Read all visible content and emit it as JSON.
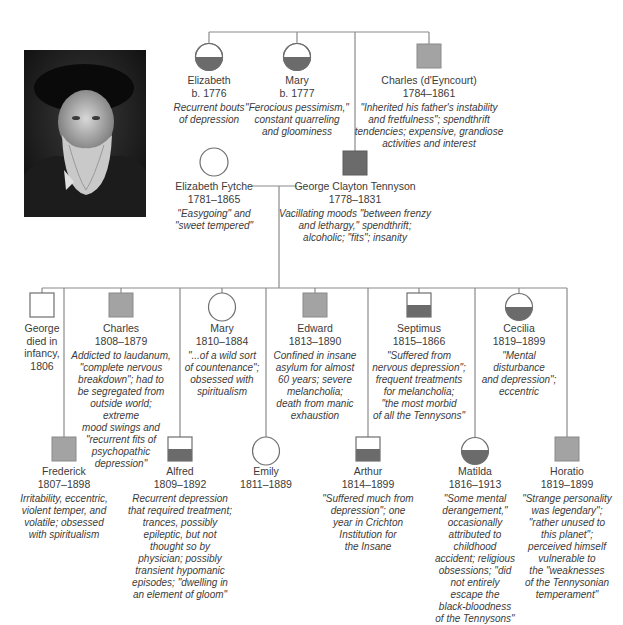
{
  "colors": {
    "line": "#8a8a8a",
    "affected_dark": "#6b6b6b",
    "affected_light": "#a3a3a3",
    "outline": "#6e6e6e"
  },
  "portrait": {
    "alt": "Portrait photograph of Alfred, Lord Tennyson"
  },
  "generation1": [
    {
      "id": "elizabeth-1776",
      "name": "Elizabeth",
      "dates": "b. 1776",
      "sex": "female",
      "fill": "half-dark",
      "desc": "Recurrent bouts\nof depression"
    },
    {
      "id": "mary-1777",
      "name": "Mary",
      "dates": "b. 1777",
      "sex": "female",
      "fill": "half-dark",
      "desc": "\"Ferocious pessimism,\"\nconstant quarreling\nand gloominess"
    },
    {
      "id": "charles-deyncourt",
      "name": "Charles (d'Eyncourt)",
      "dates": "1784–1861",
      "sex": "male",
      "fill": "light",
      "desc": "\"Inherited his father's instability\nand fretfulness\"; spendthrift\ntendencies; expensive, grandiose\nactivities and interest"
    }
  ],
  "generation2": [
    {
      "id": "elizabeth-fytche",
      "name": "Elizabeth Fytche",
      "dates": "1781–1865",
      "sex": "female",
      "fill": "none",
      "desc": "\"Easygoing\" and\n\"sweet tempered\""
    },
    {
      "id": "george-clayton-tennyson",
      "name": "George Clayton Tennyson",
      "dates": "1778–1831",
      "sex": "male",
      "fill": "dark",
      "desc": "Vacillating moods \"between frenzy\nand lethargy,\" spendthrift;\nalcoholic; \"fits\"; insanity"
    }
  ],
  "children_upper": [
    {
      "id": "george-1806",
      "name": "George\ndied in\ninfancy,\n1806",
      "dates": "",
      "sex": "male",
      "fill": "none",
      "desc": ""
    },
    {
      "id": "charles-1808",
      "name": "Charles",
      "dates": "1808–1879",
      "sex": "male",
      "fill": "light",
      "desc": "Addicted to laudanum,\n\"complete nervous\nbreakdown\"; had to\nbe segregated from\noutside world; extreme\nmood swings and\n\"recurrent fits of\npsychopathic\ndepression\""
    },
    {
      "id": "mary-1810",
      "name": "Mary",
      "dates": "1810–1884",
      "sex": "female",
      "fill": "none",
      "desc": "\"...of a wild sort\nof countenance\";\nobsessed with\nspiritualism"
    },
    {
      "id": "edward-1813",
      "name": "Edward",
      "dates": "1813–1890",
      "sex": "male",
      "fill": "light",
      "desc": "Confined in insane\nasylum for almost\n60 years; severe\nmelancholia;\ndeath from manic\nexhaustion"
    },
    {
      "id": "septimus-1815",
      "name": "Septimus",
      "dates": "1815–1866",
      "sex": "male",
      "fill": "half-dark",
      "desc": "\"Suffered from\nnervous depression\";\nfrequent treatments\nfor melancholia;\n\"the most morbid\nof all the Tennysons\""
    },
    {
      "id": "cecilia-1819",
      "name": "Cecilia",
      "dates": "1819–1899",
      "sex": "female",
      "fill": "half-dark",
      "desc": "\"Mental\ndisturbance\nand depression\";\neccentric"
    }
  ],
  "children_lower": [
    {
      "id": "frederick-1807",
      "name": "Frederick",
      "dates": "1807–1898",
      "sex": "male",
      "fill": "light",
      "desc": "Irritability, eccentric,\nviolent temper, and\nvolatile; obsessed\nwith spiritualism"
    },
    {
      "id": "alfred-1809",
      "name": "Alfred",
      "dates": "1809–1892",
      "sex": "male",
      "fill": "half-dark",
      "desc": "Recurrent depression\nthat required treatment;\ntrances, possibly\nepileptic, but not\nthought so by\nphysician; possibly\ntransient hypomanic\nepisodes; \"dwelling in\nan element of gloom\""
    },
    {
      "id": "emily-1811",
      "name": "Emily",
      "dates": "1811–1889",
      "sex": "female",
      "fill": "none",
      "desc": ""
    },
    {
      "id": "arthur-1814",
      "name": "Arthur",
      "dates": "1814–1899",
      "sex": "male",
      "fill": "half-dark",
      "desc": "\"Suffered much from\ndepression\"; one\nyear in Crichton\nInstitution for\nthe Insane"
    },
    {
      "id": "matilda-1816",
      "name": "Matilda",
      "dates": "1816–1913",
      "sex": "female",
      "fill": "half-dark",
      "desc": "\"Some mental\nderangement,\"\noccasionally\nattributed to\nchildhood\naccident; religious\nobsessions; \"did\nnot entirely\nescape the\nblack-bloodness\nof the Tennysons\""
    },
    {
      "id": "horatio-1819",
      "name": "Horatio",
      "dates": "1819–1899",
      "sex": "male",
      "fill": "light",
      "desc": "\"Strange personality\nwas legendary\";\n\"rather unused to\nthis planet\";\nperceived himself\nvulnerable to\nthe \"weaknesses\nof the Tennysonian\ntemperament\""
    }
  ]
}
